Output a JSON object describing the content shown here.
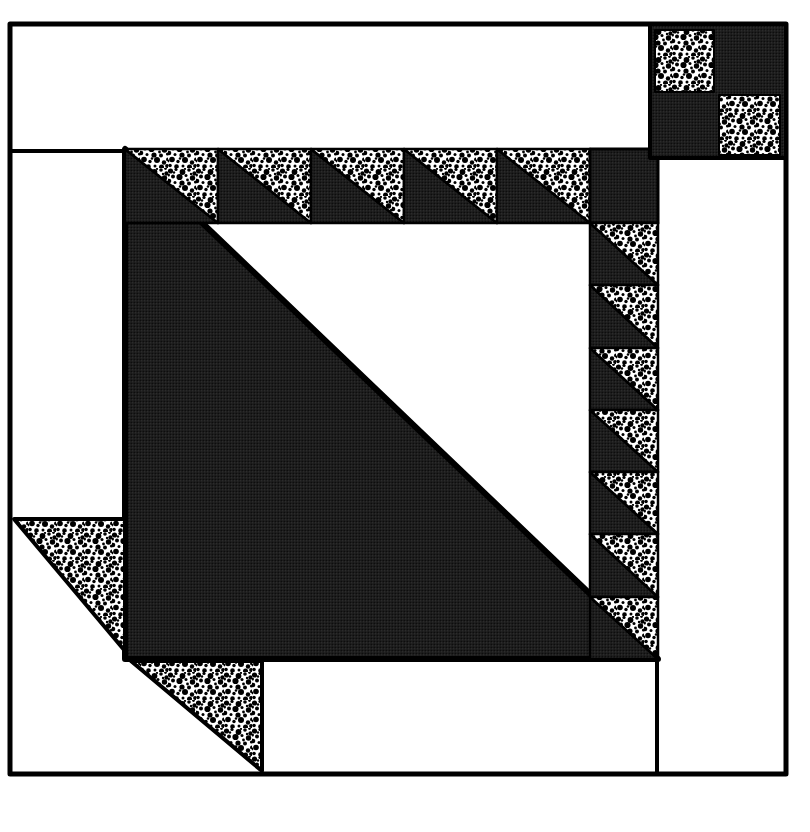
{
  "scene": {
    "canvas": {
      "w": 810,
      "h": 832,
      "bg": "#ffffff"
    },
    "palette": {
      "ink": "#000000",
      "white": "#ffffff",
      "halftone_base": "#1c1c1c",
      "halftone_dot_light": "#3d3d3d",
      "halftone_dot_dark": "#000000",
      "speckle_bg": "#ffffff",
      "speckle_ink": "#000000"
    },
    "textures": {
      "halftone": {
        "tile": 3,
        "base": "#1c1c1c",
        "dots": [
          {
            "cx": 0.75,
            "cy": 0.75,
            "r": 0.5,
            "fill": "#3d3d3d"
          },
          {
            "cx": 2.25,
            "cy": 2.25,
            "r": 0.55,
            "fill": "#000000"
          }
        ]
      },
      "speckle": {
        "tile": 28,
        "bg": "#ffffff",
        "ink": "#000000",
        "blobs": [
          [
            2.5,
            3,
            2.6
          ],
          [
            8,
            1.5,
            1.6
          ],
          [
            14.5,
            4,
            2.9
          ],
          [
            21,
            2,
            1.8
          ],
          [
            26.5,
            5.5,
            2.2
          ],
          [
            5,
            8.5,
            2.0
          ],
          [
            11.5,
            9,
            3.1
          ],
          [
            18,
            7.5,
            1.5
          ],
          [
            24.5,
            10,
            2.7
          ],
          [
            1,
            13,
            2.3
          ],
          [
            7,
            14.5,
            1.5
          ],
          [
            14,
            15,
            2.6
          ],
          [
            21,
            15.5,
            2.0
          ],
          [
            27.5,
            14,
            1.6
          ],
          [
            4,
            19.5,
            2.8
          ],
          [
            10,
            21.5,
            1.7
          ],
          [
            17,
            20,
            3.0
          ],
          [
            24,
            22.5,
            2.2
          ],
          [
            2,
            25.5,
            1.8
          ],
          [
            8.5,
            26.5,
            2.3
          ],
          [
            15,
            26,
            1.5
          ],
          [
            21.5,
            27,
            2.5
          ],
          [
            27,
            26,
            1.9
          ],
          [
            19.5,
            12,
            1.4
          ],
          [
            25.5,
            0.5,
            1.4
          ],
          [
            0.5,
            7,
            1.5
          ],
          [
            12,
            18.5,
            1.3
          ],
          [
            28,
            19.5,
            2.0
          ],
          [
            6,
            4.5,
            1.2
          ],
          [
            17,
            1,
            1.1
          ],
          [
            0,
            21,
            1.4
          ],
          [
            23,
            6,
            1.2
          ]
        ]
      }
    },
    "shapes": [
      {
        "name": "outer-border",
        "kind": "rect",
        "x": 10,
        "y": 24,
        "w": 776,
        "h": 750,
        "fill": "none",
        "stroke": 5
      },
      {
        "name": "top-strip-divider-line",
        "kind": "line",
        "x1": 10,
        "y1": 151,
        "x2": 650,
        "y2": 151,
        "stroke": 4
      },
      {
        "name": "center-large-triangle-dark",
        "kind": "polygon",
        "points": [
          [
            125,
            149
          ],
          [
            125,
            659
          ],
          [
            658,
            659
          ]
        ],
        "fill": "dark",
        "stroke": 6
      },
      {
        "name": "top-sawtooth-unit-1-dark",
        "kind": "polygon",
        "points": [
          [
            125,
            149
          ],
          [
            125,
            223
          ],
          [
            218,
            223
          ]
        ],
        "fill": "dark",
        "stroke": 2.5
      },
      {
        "name": "top-sawtooth-unit-1-stipple",
        "kind": "polygon",
        "points": [
          [
            125,
            149
          ],
          [
            218,
            149
          ],
          [
            218,
            223
          ]
        ],
        "fill": "stipple",
        "stroke": 2.5
      },
      {
        "name": "top-sawtooth-unit-2-dark",
        "kind": "polygon",
        "points": [
          [
            218,
            149
          ],
          [
            218,
            223
          ],
          [
            311,
            223
          ]
        ],
        "fill": "dark",
        "stroke": 2.5
      },
      {
        "name": "top-sawtooth-unit-2-stipple",
        "kind": "polygon",
        "points": [
          [
            218,
            149
          ],
          [
            311,
            149
          ],
          [
            311,
            223
          ]
        ],
        "fill": "stipple",
        "stroke": 2.5
      },
      {
        "name": "top-sawtooth-unit-3-dark",
        "kind": "polygon",
        "points": [
          [
            311,
            149
          ],
          [
            311,
            223
          ],
          [
            404,
            223
          ]
        ],
        "fill": "dark",
        "stroke": 2.5
      },
      {
        "name": "top-sawtooth-unit-3-stipple",
        "kind": "polygon",
        "points": [
          [
            311,
            149
          ],
          [
            404,
            149
          ],
          [
            404,
            223
          ]
        ],
        "fill": "stipple",
        "stroke": 2.5
      },
      {
        "name": "top-sawtooth-unit-4-dark",
        "kind": "polygon",
        "points": [
          [
            404,
            149
          ],
          [
            404,
            223
          ],
          [
            497,
            223
          ]
        ],
        "fill": "dark",
        "stroke": 2.5
      },
      {
        "name": "top-sawtooth-unit-4-stipple",
        "kind": "polygon",
        "points": [
          [
            404,
            149
          ],
          [
            497,
            149
          ],
          [
            497,
            223
          ]
        ],
        "fill": "stipple",
        "stroke": 2.5
      },
      {
        "name": "top-sawtooth-unit-5-dark",
        "kind": "polygon",
        "points": [
          [
            497,
            149
          ],
          [
            497,
            223
          ],
          [
            590,
            223
          ]
        ],
        "fill": "dark",
        "stroke": 2.5
      },
      {
        "name": "top-sawtooth-unit-5-stipple",
        "kind": "polygon",
        "points": [
          [
            497,
            149
          ],
          [
            590,
            149
          ],
          [
            590,
            223
          ]
        ],
        "fill": "stipple",
        "stroke": 2.5
      },
      {
        "name": "sawtooth-corner-square-dark",
        "kind": "rect",
        "x": 590,
        "y": 149,
        "w": 68,
        "h": 74,
        "fill": "dark",
        "stroke": 3
      },
      {
        "name": "right-sawtooth-unit-1-dark",
        "kind": "polygon",
        "points": [
          [
            590,
            223
          ],
          [
            590,
            285
          ],
          [
            658,
            285
          ]
        ],
        "fill": "dark",
        "stroke": 2.5
      },
      {
        "name": "right-sawtooth-unit-1-stipple",
        "kind": "polygon",
        "points": [
          [
            590,
            223
          ],
          [
            658,
            223
          ],
          [
            658,
            285
          ]
        ],
        "fill": "stipple",
        "stroke": 2.5
      },
      {
        "name": "right-sawtooth-unit-2-dark",
        "kind": "polygon",
        "points": [
          [
            590,
            285
          ],
          [
            590,
            348
          ],
          [
            658,
            348
          ]
        ],
        "fill": "dark",
        "stroke": 2.5
      },
      {
        "name": "right-sawtooth-unit-2-stipple",
        "kind": "polygon",
        "points": [
          [
            590,
            285
          ],
          [
            658,
            285
          ],
          [
            658,
            348
          ]
        ],
        "fill": "stipple",
        "stroke": 2.5
      },
      {
        "name": "right-sawtooth-unit-3-dark",
        "kind": "polygon",
        "points": [
          [
            590,
            348
          ],
          [
            590,
            410
          ],
          [
            658,
            410
          ]
        ],
        "fill": "dark",
        "stroke": 2.5
      },
      {
        "name": "right-sawtooth-unit-3-stipple",
        "kind": "polygon",
        "points": [
          [
            590,
            348
          ],
          [
            658,
            348
          ],
          [
            658,
            410
          ]
        ],
        "fill": "stipple",
        "stroke": 2.5
      },
      {
        "name": "right-sawtooth-unit-4-dark",
        "kind": "polygon",
        "points": [
          [
            590,
            410
          ],
          [
            590,
            472
          ],
          [
            658,
            472
          ]
        ],
        "fill": "dark",
        "stroke": 2.5
      },
      {
        "name": "right-sawtooth-unit-4-stipple",
        "kind": "polygon",
        "points": [
          [
            590,
            410
          ],
          [
            658,
            410
          ],
          [
            658,
            472
          ]
        ],
        "fill": "stipple",
        "stroke": 2.5
      },
      {
        "name": "right-sawtooth-unit-5-dark",
        "kind": "polygon",
        "points": [
          [
            590,
            472
          ],
          [
            590,
            534
          ],
          [
            658,
            534
          ]
        ],
        "fill": "dark",
        "stroke": 2.5
      },
      {
        "name": "right-sawtooth-unit-5-stipple",
        "kind": "polygon",
        "points": [
          [
            590,
            472
          ],
          [
            658,
            472
          ],
          [
            658,
            534
          ]
        ],
        "fill": "stipple",
        "stroke": 2.5
      },
      {
        "name": "right-sawtooth-unit-6-dark",
        "kind": "polygon",
        "points": [
          [
            590,
            534
          ],
          [
            590,
            597
          ],
          [
            658,
            597
          ]
        ],
        "fill": "dark",
        "stroke": 2.5
      },
      {
        "name": "right-sawtooth-unit-6-stipple",
        "kind": "polygon",
        "points": [
          [
            590,
            534
          ],
          [
            658,
            534
          ],
          [
            658,
            597
          ]
        ],
        "fill": "stipple",
        "stroke": 2.5
      },
      {
        "name": "right-sawtooth-unit-7-dark",
        "kind": "polygon",
        "points": [
          [
            590,
            597
          ],
          [
            590,
            659
          ],
          [
            658,
            659
          ]
        ],
        "fill": "dark",
        "stroke": 2.5
      },
      {
        "name": "right-sawtooth-unit-7-stipple",
        "kind": "polygon",
        "points": [
          [
            590,
            597
          ],
          [
            658,
            597
          ],
          [
            658,
            659
          ]
        ],
        "fill": "stipple",
        "stroke": 2.5
      },
      {
        "name": "mountain-step-triangle-left-stipple",
        "kind": "polygon",
        "points": [
          [
            14,
            519
          ],
          [
            125,
            519
          ],
          [
            125,
            651
          ]
        ],
        "fill": "stipple",
        "stroke": 4
      },
      {
        "name": "mountain-step-triangle-bottom-stipple",
        "kind": "polygon",
        "points": [
          [
            131,
            661
          ],
          [
            262,
            661
          ],
          [
            262,
            771
          ]
        ],
        "fill": "stipple",
        "stroke": 4
      },
      {
        "name": "bottom-margin-divider-line",
        "kind": "line",
        "x1": 657,
        "y1": 659,
        "x2": 657,
        "y2": 772,
        "stroke": 4
      },
      {
        "name": "corner-four-patch-dark-bg",
        "kind": "rect",
        "x": 650,
        "y": 24,
        "w": 136,
        "h": 134,
        "fill": "dark",
        "stroke": 4
      },
      {
        "name": "four-patch-stipple-square-top-left",
        "kind": "rect",
        "x": 655,
        "y": 30,
        "w": 59,
        "h": 62,
        "fill": "stipple",
        "stroke": 2
      },
      {
        "name": "four-patch-stipple-square-bottom-right",
        "kind": "rect",
        "x": 719,
        "y": 95,
        "w": 61,
        "h": 60,
        "fill": "stipple",
        "stroke": 2
      }
    ]
  }
}
